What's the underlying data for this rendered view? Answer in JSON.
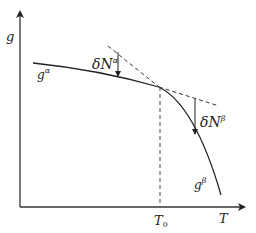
{
  "diagram": {
    "title": "",
    "axes": {
      "y_label": "g",
      "x_label": "T",
      "x_marker": {
        "label": "T",
        "subscript": "0"
      }
    },
    "curves": [
      {
        "name": "alpha-curve",
        "label": "g",
        "superscript": "α"
      },
      {
        "name": "beta-curve",
        "label": "g",
        "superscript": "β"
      }
    ],
    "annotations": [
      {
        "name": "delta-n-alpha",
        "label": "δN",
        "superscript": "α"
      },
      {
        "name": "delta-n-beta",
        "label": "δN",
        "superscript": "β"
      }
    ],
    "colors": {
      "line": "#222222",
      "dashed": "#333333"
    }
  }
}
